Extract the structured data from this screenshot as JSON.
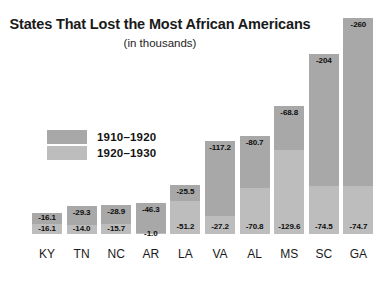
{
  "chart_data": {
    "type": "bar",
    "title": "States That Lost the Most African Americans",
    "subtitle": "(in thousands)",
    "xlabel": "",
    "ylabel": "",
    "grid": false,
    "stacked": true,
    "legend_position": "inside-left",
    "categories": [
      "KY",
      "TN",
      "NC",
      "AR",
      "LA",
      "VA",
      "AL",
      "MS",
      "SC",
      "GA"
    ],
    "series": [
      {
        "name": "1910–1920",
        "color": "#a8a8a8",
        "values": [
          -16.1,
          -29.3,
          -28.9,
          -46.3,
          -25.5,
          -117.2,
          -80.7,
          -68.8,
          -204,
          -260
        ],
        "labels": [
          "-16.1",
          "-29.3",
          "-28.9",
          "-46.3",
          "-25.5",
          "-117.2",
          "-80.7",
          "-68.8",
          "-204",
          "-260"
        ]
      },
      {
        "name": "1920–1930",
        "color": "#bdbdbd",
        "values": [
          -16.1,
          -14.0,
          -15.7,
          -1.0,
          -51.2,
          -27.2,
          -70.8,
          -129.6,
          -74.5,
          -74.7
        ],
        "labels": [
          "-16.1",
          "-14.0",
          "-15.7",
          "-1.0",
          "-51.2",
          "-27.2",
          "-70.8",
          "-129.6",
          "-74.5",
          "-74.7"
        ]
      }
    ],
    "totals": [
      -32.2,
      -43.3,
      -44.6,
      -47.3,
      -76.7,
      -144.4,
      -151.5,
      -198.4,
      -278.5,
      -334.7
    ]
  },
  "legend": {
    "items": [
      {
        "label": "1910–1920",
        "swatch": "#a8a8a8"
      },
      {
        "label": "1920–1930",
        "swatch": "#bdbdbd"
      }
    ]
  }
}
